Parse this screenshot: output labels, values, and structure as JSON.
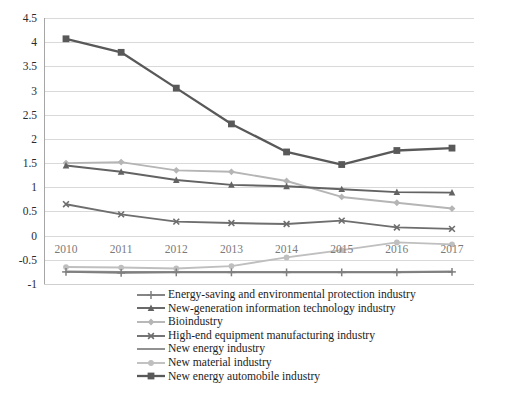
{
  "chart_data": {
    "type": "line",
    "title": "",
    "xlabel": "",
    "ylabel": "",
    "categories": [
      "2010",
      "2011",
      "2012",
      "2013",
      "2014",
      "2015",
      "2016",
      "2017"
    ],
    "ylim": [
      -1,
      4.5
    ],
    "yticks": [
      "4.5",
      "4",
      "3.5",
      "3",
      "2.5",
      "2",
      "1.5",
      "1",
      "0.5",
      "0",
      "-0.5",
      "-1"
    ],
    "ytick_values": [
      4.5,
      4,
      3.5,
      3,
      2.5,
      2,
      1.5,
      1,
      0.5,
      0,
      -0.5,
      -1
    ],
    "grid": "horizontal",
    "legend_position": "bottom",
    "series": [
      {
        "name": "Energy-saving and environmental protection industry",
        "marker": "plus",
        "color": "#7f7f7f",
        "values": [
          -0.75,
          -0.77,
          -0.76,
          -0.76,
          -0.76,
          -0.76,
          -0.76,
          -0.75
        ]
      },
      {
        "name": "New-generation information technology industry",
        "marker": "triangle",
        "color": "#636363",
        "values": [
          1.45,
          1.32,
          1.15,
          1.05,
          1.02,
          0.96,
          0.9,
          0.89
        ]
      },
      {
        "name": "Bioindustry",
        "marker": "diamond",
        "color": "#b5b5b5",
        "values": [
          1.5,
          1.52,
          1.35,
          1.32,
          1.13,
          0.8,
          0.68,
          0.56
        ]
      },
      {
        "name": "High-end equipment manufacturing industry",
        "marker": "cross",
        "color": "#6e6e6e",
        "values": [
          0.65,
          0.44,
          0.29,
          0.26,
          0.24,
          0.31,
          0.17,
          0.14
        ]
      },
      {
        "name": "New energy industry",
        "marker": "none",
        "color": "#8c8c8c",
        "values": [
          -0.74,
          -0.75,
          -0.75,
          -0.75,
          -0.75,
          -0.75,
          -0.75,
          -0.74
        ]
      },
      {
        "name": "New material industry",
        "marker": "circle",
        "color": "#bfbfbf",
        "values": [
          -0.65,
          -0.66,
          -0.68,
          -0.63,
          -0.45,
          -0.3,
          -0.14,
          -0.18
        ]
      },
      {
        "name": "New energy automobile industry",
        "marker": "square",
        "color": "#595959",
        "values": [
          4.07,
          3.79,
          3.05,
          2.31,
          1.73,
          1.47,
          1.76,
          1.81
        ]
      }
    ]
  },
  "legend": {
    "items": [
      {
        "label": "Energy-saving and environmental protection industry"
      },
      {
        "label": "New-generation information technology industry"
      },
      {
        "label": "Bioindustry"
      },
      {
        "label": "High-end equipment manufacturing industry"
      },
      {
        "label": "New energy industry"
      },
      {
        "label": "New material industry"
      },
      {
        "label": "New energy automobile industry"
      }
    ]
  }
}
